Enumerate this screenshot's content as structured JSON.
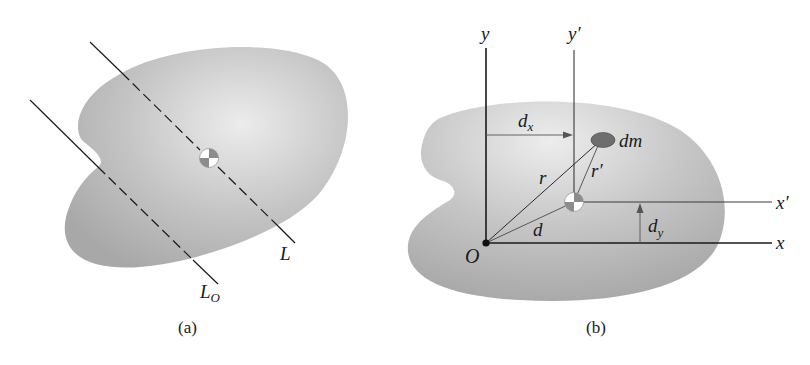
{
  "figure_a": {
    "caption": "(a)",
    "labels": {
      "axis_L": "L",
      "axis_LO_main": "L",
      "axis_LO_sub": "O"
    }
  },
  "figure_b": {
    "caption": "(b)",
    "labels": {
      "y": "y",
      "y_prime": "y′",
      "x": "x",
      "x_prime": "x′",
      "origin": "O",
      "dx_main": "d",
      "dx_sub": "x",
      "dy_main": "d",
      "dy_sub": "y",
      "dm": "dm",
      "r": "r",
      "r_prime": "r′",
      "d": "d"
    }
  },
  "colors": {
    "body_fill_dark": "#a9a9a9",
    "body_fill_light": "#e6e6e6",
    "line": "#1a1a1a",
    "thin_line": "#555555",
    "dm_fill": "#6e6e6e"
  }
}
